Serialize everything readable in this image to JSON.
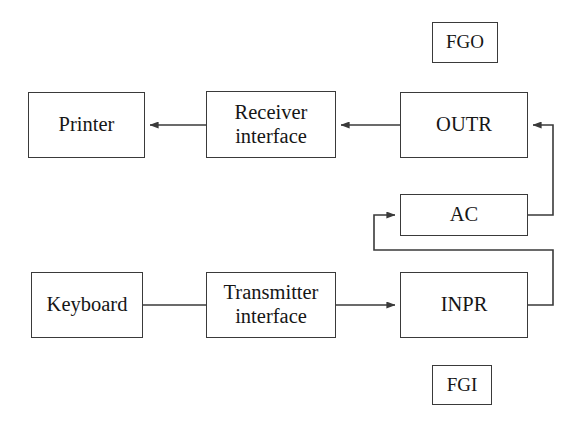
{
  "diagram": {
    "background_color": "#ffffff",
    "line_color": "#3a3a3a",
    "text_color": "#161616",
    "nodes": [
      {
        "id": "fgo",
        "label": "FGO",
        "x": 432,
        "y": 22,
        "w": 66,
        "h": 41,
        "size": "sm"
      },
      {
        "id": "printer",
        "label": "Printer",
        "x": 28,
        "y": 92,
        "w": 117,
        "h": 66,
        "size": "lg"
      },
      {
        "id": "receiver",
        "label": "Receiver\ninterface",
        "x": 206,
        "y": 91,
        "w": 130,
        "h": 67,
        "size": "lg"
      },
      {
        "id": "outr",
        "label": "OUTR",
        "x": 400,
        "y": 92,
        "w": 128,
        "h": 66,
        "size": "lg"
      },
      {
        "id": "ac",
        "label": "AC",
        "x": 400,
        "y": 194,
        "w": 128,
        "h": 42,
        "size": "lg"
      },
      {
        "id": "keyboard",
        "label": "Keyboard",
        "x": 31,
        "y": 272,
        "w": 112,
        "h": 66,
        "size": "lg"
      },
      {
        "id": "transmitter",
        "label": "Transmitter\ninterface",
        "x": 206,
        "y": 272,
        "w": 130,
        "h": 66,
        "size": "lg"
      },
      {
        "id": "inpr",
        "label": "INPR",
        "x": 400,
        "y": 272,
        "w": 128,
        "h": 66,
        "size": "lg"
      },
      {
        "id": "fgi",
        "label": "FGI",
        "x": 432,
        "y": 365,
        "w": 60,
        "h": 40,
        "size": "sm"
      }
    ],
    "edges": [
      {
        "id": "outr-to-receiver",
        "from": "outr",
        "to": "receiver",
        "arrow": true,
        "d": "M 400 125 L 341 125"
      },
      {
        "id": "receiver-to-printer",
        "from": "receiver",
        "to": "printer",
        "arrow": true,
        "d": "M 206 125 L 150 125"
      },
      {
        "id": "ac-to-outr",
        "from": "ac",
        "to": "outr",
        "arrow": true,
        "d": "M 528 215 L 553 215 L 553 125 L 533 125"
      },
      {
        "id": "inpr-to-ac",
        "from": "inpr",
        "to": "ac",
        "arrow": true,
        "d": "M 528 305 L 553 305 L 553 250 L 374 250 L 374 215 L 395 215"
      },
      {
        "id": "keyboard-to-transmitter",
        "from": "keyboard",
        "to": "transmitter",
        "arrow": false,
        "d": "M 143 305 L 206 305"
      },
      {
        "id": "transmitter-to-inpr",
        "from": "transmitter",
        "to": "inpr",
        "arrow": true,
        "d": "M 336 305 L 395 305"
      }
    ]
  }
}
